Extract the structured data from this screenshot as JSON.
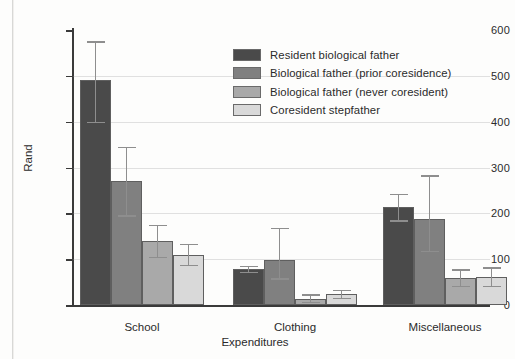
{
  "figure": {
    "background": "#fdfdfc",
    "series_colors": [
      "#4a4a4a",
      "#808080",
      "#a9a9a9",
      "#d9d9d9"
    ],
    "error_bar_color": "#8e8e8e",
    "axis_color": "#3a3a3a"
  },
  "legend": {
    "position": "top-right-inside",
    "items": [
      {
        "label": "Resident biological father",
        "color": "#4a4a4a"
      },
      {
        "label": "Biological father (prior coresidence)",
        "color": "#808080"
      },
      {
        "label": "Biological father (never coresident)",
        "color": "#a9a9a9"
      },
      {
        "label": "Coresident stepfather",
        "color": "#d9d9d9"
      }
    ]
  },
  "chart_data": {
    "type": "bar",
    "title": "",
    "subtitle": "",
    "xlabel": "Expenditures",
    "ylabel": "Rand",
    "categories": [
      "School",
      "Clothing",
      "Miscellaneous"
    ],
    "ylim": [
      0,
      600
    ],
    "yticks": [
      0,
      100,
      200,
      300,
      400,
      500,
      600
    ],
    "ytick_labels": [
      "0",
      "100",
      "200",
      "300",
      "400",
      "500",
      "600"
    ],
    "grid": true,
    "grid_axis": "y",
    "legend_position": "upper right",
    "error_bars": "95% confidence interval",
    "series": [
      {
        "name": "Resident biological father",
        "color": "#4a4a4a",
        "values": [
          490,
          78,
          213
        ],
        "err_low": [
          400,
          72,
          185
        ],
        "err_high": [
          575,
          85,
          243
        ]
      },
      {
        "name": "Biological father (prior coresidence)",
        "color": "#808080",
        "values": [
          270,
          99,
          187
        ],
        "err_low": [
          196,
          58,
          118
        ],
        "err_high": [
          345,
          168,
          283
        ]
      },
      {
        "name": "Biological father (never coresident)",
        "color": "#a9a9a9",
        "values": [
          139,
          14,
          59
        ],
        "err_low": [
          105,
          7,
          42
        ],
        "err_high": [
          175,
          23,
          78
        ]
      },
      {
        "name": "Coresident stepfather",
        "color": "#d9d9d9",
        "values": [
          110,
          24,
          61
        ],
        "err_low": [
          88,
          16,
          42
        ],
        "err_high": [
          133,
          33,
          82
        ]
      }
    ]
  }
}
